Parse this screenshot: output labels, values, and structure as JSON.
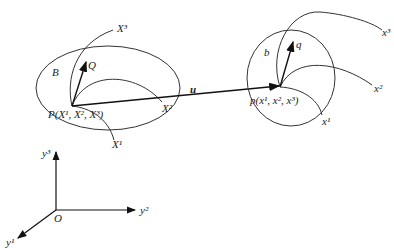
{
  "diagram": {
    "title": "",
    "initial_config": {
      "region_label": "B",
      "vector_label": "Q",
      "point_label": "P(X¹, X², X³)",
      "axes": [
        "X¹",
        "X²",
        "X³"
      ]
    },
    "current_config": {
      "region_label": "b",
      "vector_label": "q",
      "point_label": "p(x¹, x², x³)",
      "axes": [
        "x¹",
        "x²",
        "x³"
      ]
    },
    "displacement_label": "u",
    "global_frame": {
      "origin_label": "O",
      "axes": [
        "y¹",
        "y²",
        "y³"
      ]
    }
  }
}
